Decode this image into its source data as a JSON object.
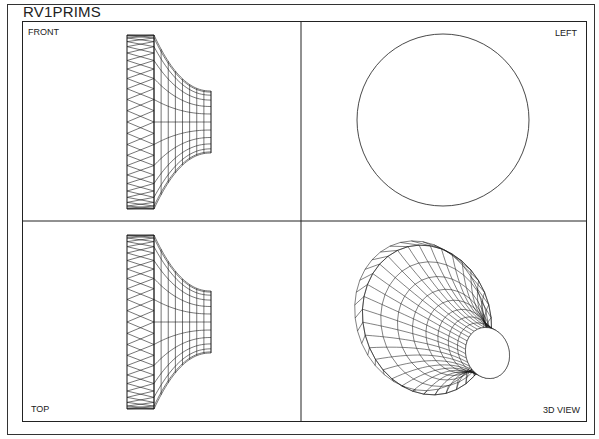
{
  "drawing": {
    "title": "RV1PRIMS",
    "viewports": [
      {
        "name": "front",
        "label": "FRONT"
      },
      {
        "name": "left",
        "label": "LEFT"
      },
      {
        "name": "top",
        "label": "TOP"
      },
      {
        "name": "3d",
        "label": "3D VIEW"
      }
    ]
  },
  "colors": {
    "line": "#1a1a1a",
    "background": "#ffffff"
  }
}
